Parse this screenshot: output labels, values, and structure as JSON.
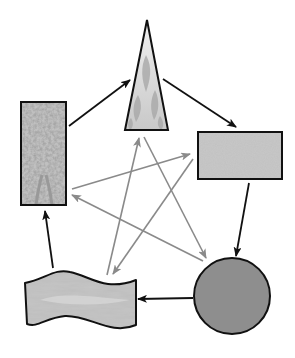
{
  "diagram": {
    "type": "cycle",
    "nodes": [
      {
        "id": "wood",
        "shape": "tall-rectangle",
        "texture": "foliage",
        "label": "Wood"
      },
      {
        "id": "fire",
        "shape": "triangle",
        "texture": "flames",
        "label": "Fire"
      },
      {
        "id": "earth",
        "shape": "rectangle",
        "texture": "speckled",
        "label": "Earth"
      },
      {
        "id": "metal",
        "shape": "circle",
        "texture": "solid-gray",
        "label": "Metal"
      },
      {
        "id": "water",
        "shape": "wavy-rectangle",
        "texture": "waves",
        "label": "Water"
      }
    ],
    "generating_cycle": {
      "color": "#111111",
      "edges": [
        [
          "wood",
          "fire"
        ],
        [
          "fire",
          "earth"
        ],
        [
          "earth",
          "metal"
        ],
        [
          "metal",
          "water"
        ],
        [
          "water",
          "wood"
        ]
      ]
    },
    "overcoming_cycle": {
      "color": "#808080",
      "edges": [
        [
          "wood",
          "earth"
        ],
        [
          "earth",
          "water"
        ],
        [
          "water",
          "fire"
        ],
        [
          "fire",
          "metal"
        ],
        [
          "metal",
          "wood"
        ]
      ]
    },
    "colors": {
      "outline": "#111111",
      "wood_fill": "#b8b8b8",
      "fire_fill": "#d8d8d8",
      "earth_fill": "#c4c4c4",
      "metal_fill": "#8e8e8e",
      "water_fill": "#bdbdbd",
      "gray_arrow": "#8a8a8a"
    }
  }
}
